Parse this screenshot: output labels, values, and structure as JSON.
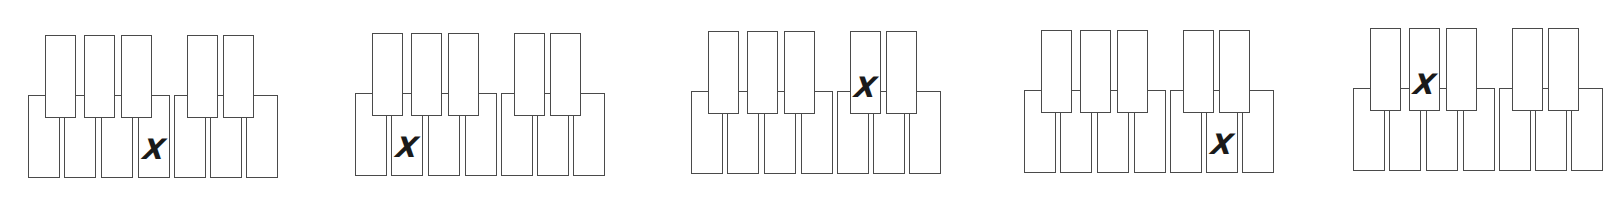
{
  "figure": {
    "stroke_color": "#4a4a4a",
    "mark_color": "#1a1a1a",
    "mark_symbol": "X",
    "white_key_count": 7,
    "black_key_count": 5
  },
  "panels": [
    {
      "index": 1,
      "marked_key": {
        "type": "white",
        "position": 4
      },
      "mark": "X"
    },
    {
      "index": 2,
      "marked_key": {
        "type": "white",
        "position": 2
      },
      "mark": "X"
    },
    {
      "index": 3,
      "marked_key": {
        "type": "black",
        "position": 4
      },
      "mark": "X"
    },
    {
      "index": 4,
      "marked_key": {
        "type": "white",
        "position": 6
      },
      "mark": "X"
    },
    {
      "index": 5,
      "marked_key": {
        "type": "black",
        "position": 2
      },
      "mark": "X"
    }
  ]
}
